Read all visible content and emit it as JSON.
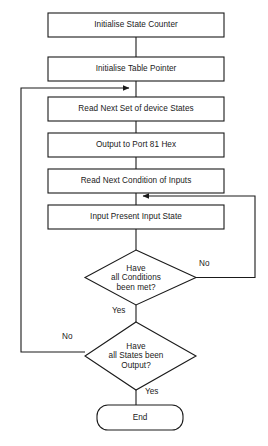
{
  "diagram": {
    "type": "flowchart",
    "background_color": "#ffffff",
    "line_color": "#1a1a1a",
    "text_color": "#1a1a1a",
    "nodes": [
      {
        "id": "n1",
        "shape": "process",
        "label": "Initialise State Counter"
      },
      {
        "id": "n2",
        "shape": "process",
        "label": "Initialise Table Pointer"
      },
      {
        "id": "n3",
        "shape": "process",
        "label": "Read Next Set of device States"
      },
      {
        "id": "n4",
        "shape": "process",
        "label": "Output to Port 81 Hex"
      },
      {
        "id": "n5",
        "shape": "process",
        "label": "Read Next Condition of Inputs"
      },
      {
        "id": "n6",
        "shape": "process",
        "label": "Input Present Input State"
      },
      {
        "id": "d1",
        "shape": "decision",
        "line1": "Have",
        "line2": "all Conditions",
        "line3": "been met?"
      },
      {
        "id": "d2",
        "shape": "decision",
        "line1": "Have",
        "line2": "all States been",
        "line3": "Output?"
      },
      {
        "id": "n7",
        "shape": "terminator",
        "label": "End"
      }
    ],
    "edge_labels": {
      "d1_no": "No",
      "d1_yes": "Yes",
      "d2_no": "No",
      "d2_yes": "Yes"
    }
  }
}
